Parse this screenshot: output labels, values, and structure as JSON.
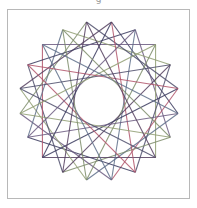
{
  "caption": "g",
  "figure": {
    "frame": {
      "x": 7,
      "y": 9,
      "width": 183,
      "height": 190,
      "border_color": "#b8b8b8"
    },
    "star": {
      "center": [
        99,
        101
      ],
      "outer_radius": 80,
      "points": 20,
      "rotation_offset_deg": 9,
      "steps": [
        5,
        8
      ],
      "line_width": 1.1,
      "colors": [
        "#3a3a5e",
        "#6b5a80",
        "#8f9e72",
        "#4d4d6b",
        "#b0546a",
        "#5e6e8a",
        "#7d8c6a",
        "#55405f"
      ]
    }
  }
}
